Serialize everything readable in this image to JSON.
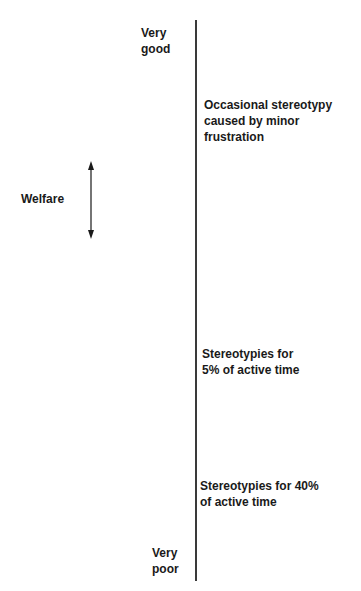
{
  "diagram": {
    "axis": {
      "name": "Welfare",
      "top_label": [
        "Very",
        "good"
      ],
      "bottom_label": [
        "Very",
        "poor"
      ]
    },
    "annotations": [
      {
        "lines": [
          "Occasional stereotypy",
          "caused by minor",
          "frustration"
        ]
      },
      {
        "lines": [
          "Stereotypies for",
          "5% of active time"
        ]
      },
      {
        "lines": [
          "Stereotypies for 40%",
          "of active time"
        ]
      }
    ],
    "icons": {
      "welfare_arrow": "double-headed-vertical-arrow"
    },
    "colors": {
      "line": "#3a3a3a",
      "text": "#1a1a1a",
      "background": "#ffffff"
    }
  }
}
